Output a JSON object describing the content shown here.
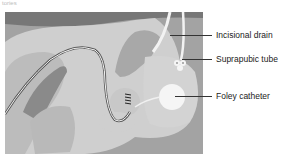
{
  "caption": "tories",
  "figure": {
    "colors": {
      "background": "#9a9a9a",
      "tissue_light": "#d9d9d9",
      "tissue_mid": "#bdbdbd",
      "tissue_dark": "#7a7a7a",
      "tube": "#f2f2f2",
      "bladder": "#c9c9c9",
      "balloon": "#f7f7f7"
    }
  },
  "labels": [
    {
      "id": "incisional-drain",
      "text": "Incisional drain"
    },
    {
      "id": "suprapubic-tube",
      "text": "Suprapubic tube"
    },
    {
      "id": "foley-catheter",
      "text": "Foley catheter"
    }
  ]
}
